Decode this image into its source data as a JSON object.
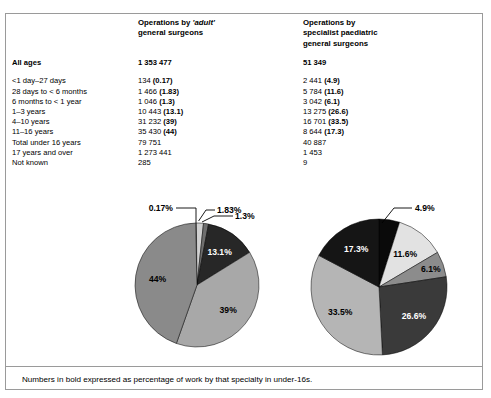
{
  "table": {
    "columns": [
      {
        "key": "label",
        "header_lines": []
      },
      {
        "key": "adult",
        "header_lines": [
          "Operations by ",
          "general surgeons"
        ],
        "header_emphasis": "adult"
      },
      {
        "key": "paed",
        "header_lines": [
          "Operations by",
          "specialist paediatric",
          "general surgeons"
        ]
      }
    ],
    "header": {
      "adult_line1_pre": "Operations by ",
      "adult_line1_em": "'adult'",
      "adult_line2": "general surgeons",
      "paed_line1": "Operations by",
      "paed_line2": "specialist paediatric",
      "paed_line3": "general surgeons"
    },
    "all_ages": {
      "label": "All ages",
      "adult": "1 353 477",
      "paed": "51 349"
    },
    "rows": [
      {
        "label": "<1 day–27 days",
        "adult_value": "134 ",
        "adult_pct": "(0.17)",
        "paed_value": "2 441 ",
        "paed_pct": "(4.9)"
      },
      {
        "label": "28 days to < 6 months",
        "adult_value": "1 466 ",
        "adult_pct": "(1.83)",
        "paed_value": "5 784 ",
        "paed_pct": "(11.6)"
      },
      {
        "label": "6 months to < 1 year",
        "adult_value": "1 046 ",
        "adult_pct": "(1.3)",
        "paed_value": "3 042 ",
        "paed_pct": "(6.1)"
      },
      {
        "label": "1–3 years",
        "adult_value": "10 443 ",
        "adult_pct": "(13.1)",
        "paed_value": "13 275 ",
        "paed_pct": "(26.6)"
      },
      {
        "label": "4–10 years",
        "adult_value": "31 232 ",
        "adult_pct": "(39)",
        "paed_value": "16 701 ",
        "paed_pct": "(33.5)"
      },
      {
        "label": "11–16 years",
        "adult_value": "35 430 ",
        "adult_pct": "(44)",
        "paed_value": "8 644 ",
        "paed_pct": "(17.3)"
      },
      {
        "label": "Total under 16 years",
        "adult_value": "79 751",
        "adult_pct": "",
        "paed_value": "40 887",
        "paed_pct": ""
      },
      {
        "label": "17 years and over",
        "adult_value": "1 273 441",
        "adult_pct": "",
        "paed_value": "1 453",
        "paed_pct": ""
      },
      {
        "label": "Not known",
        "adult_value": "285",
        "adult_pct": "",
        "paed_value": "9",
        "paed_pct": ""
      }
    ]
  },
  "footnote": "Numbers in bold expressed as percentage of work by that specialty in under-16s.",
  "chart_data": [
    {
      "type": "pie",
      "name": "adult-general-surgeons-pie",
      "title": "Operations by 'adult' general surgeons",
      "total": 79751,
      "categories": [
        "<1 day–27 days",
        "28 days to < 6 months",
        "6 months to < 1 year",
        "1–3 years",
        "4–10 years",
        "11–16 years"
      ],
      "values": [
        134,
        1466,
        1046,
        10443,
        31232,
        35430
      ],
      "percent_labels": [
        "0.17%",
        "1.83%",
        "1.3%",
        "13.1%",
        "39%",
        "44%"
      ],
      "percents": [
        0.17,
        1.83,
        1.3,
        13.1,
        39,
        44
      ],
      "slice_colors": [
        "#f2f2f2",
        "#d0d0d0",
        "#6e6e6e",
        "#272727",
        "#a8a8a8",
        "#8a8a8a"
      ],
      "label_styles": [
        "callout",
        "callout",
        "callout",
        "light",
        "dark",
        "dark"
      ],
      "legend": "none"
    },
    {
      "type": "pie",
      "name": "specialist-paediatric-surgeons-pie",
      "title": "Operations by specialist paediatric general surgeons",
      "total": 40887,
      "categories": [
        "<1 day–27 days",
        "28 days to < 6 months",
        "6 months to < 1 year",
        "1–3 years",
        "4–10 years",
        "11–16 years"
      ],
      "values": [
        2441,
        5784,
        3042,
        13275,
        16701,
        8644
      ],
      "percent_labels": [
        "4.9%",
        "11.6%",
        "6.1%",
        "26.6%",
        "33.5%",
        "17.3%"
      ],
      "percents": [
        4.9,
        11.6,
        6.1,
        26.6,
        33.5,
        17.3
      ],
      "slice_colors": [
        "#0a0a0a",
        "#e2e2e2",
        "#8c8c8c",
        "#3a3a3a",
        "#b5b5b5",
        "#151515"
      ],
      "label_styles": [
        "callout",
        "dark",
        "dark",
        "light",
        "dark",
        "light"
      ],
      "legend": "none"
    }
  ]
}
